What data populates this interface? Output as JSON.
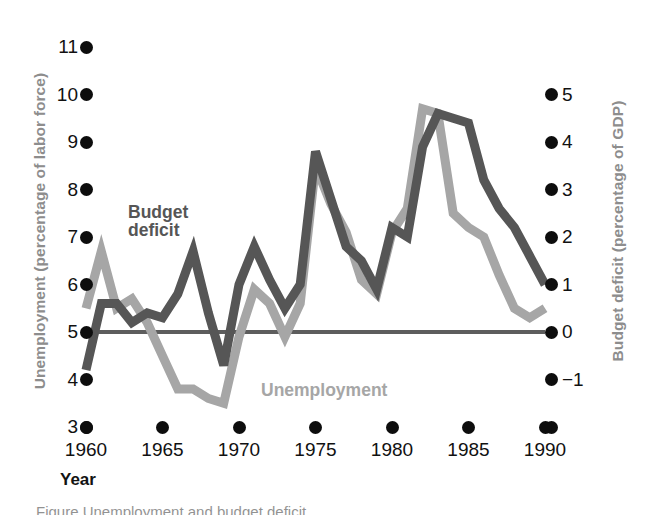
{
  "chart_data": {
    "type": "line",
    "title": "",
    "xlabel": "Year",
    "x_ticks": [
      "1960",
      "1965",
      "1970",
      "1975",
      "1980",
      "1985",
      "1990"
    ],
    "xlim": [
      1959,
      1991
    ],
    "grid": false,
    "legend_position": "inline-annotations",
    "axes": {
      "left": {
        "label": "Unemployment (percentage of labor force)",
        "ticks": [
          "11",
          "10",
          "9",
          "8",
          "7",
          "6",
          "5",
          "4",
          "3"
        ],
        "tick_values": [
          11,
          10,
          9,
          8,
          7,
          6,
          5,
          4,
          3
        ],
        "lim": [
          3,
          11
        ]
      },
      "right": {
        "label": "Budget deficit (percentage of GDP)",
        "ticks": [
          "5",
          "4",
          "3",
          "2",
          "1",
          "0",
          "−1"
        ],
        "tick_values": [
          5,
          4,
          3,
          2,
          1,
          0,
          -1
        ],
        "lim": [
          -2,
          5
        ]
      }
    },
    "reference_line": {
      "axis": "right",
      "value": 0,
      "color": "#5d5d5d"
    },
    "series": [
      {
        "name": "Budget deficit",
        "axis": "right",
        "color": "#565656",
        "label_text": "Budget\ndeficit",
        "x": [
          1960,
          1961,
          1962,
          1963,
          1964,
          1965,
          1966,
          1967,
          1968,
          1969,
          1970,
          1971,
          1972,
          1973,
          1974,
          1975,
          1976,
          1977,
          1978,
          1979,
          1980,
          1981,
          1982,
          1983,
          1984,
          1985,
          1986,
          1987,
          1988,
          1989,
          1990
        ],
        "values": [
          -0.8,
          0.6,
          0.6,
          0.2,
          0.4,
          0.3,
          0.8,
          1.7,
          0.4,
          -0.7,
          1.0,
          1.8,
          1.1,
          0.5,
          1.0,
          3.8,
          2.8,
          1.8,
          1.5,
          0.9,
          2.2,
          2.0,
          3.9,
          4.6,
          4.5,
          4.4,
          3.2,
          2.6,
          2.2,
          1.6,
          1.0
        ]
      },
      {
        "name": "Unemployment",
        "axis": "left",
        "color": "#a6a6a6",
        "label_text": "Unemployment",
        "x": [
          1960,
          1961,
          1962,
          1963,
          1964,
          1965,
          1966,
          1967,
          1968,
          1969,
          1970,
          1971,
          1972,
          1973,
          1974,
          1975,
          1976,
          1977,
          1978,
          1979,
          1980,
          1981,
          1982,
          1983,
          1984,
          1985,
          1986,
          1987,
          1988,
          1989,
          1990
        ],
        "values": [
          5.5,
          6.7,
          5.5,
          5.7,
          5.2,
          4.5,
          3.8,
          3.8,
          3.6,
          3.5,
          4.9,
          5.9,
          5.6,
          4.9,
          5.6,
          8.5,
          7.7,
          7.1,
          6.1,
          5.8,
          7.1,
          7.6,
          9.7,
          9.6,
          7.5,
          7.2,
          7.0,
          6.2,
          5.5,
          5.3,
          5.5
        ]
      }
    ]
  },
  "labels": {
    "ylabel_left": "Unemployment (percentage of labor force)",
    "ylabel_right": "Budget deficit (percentage of GDP)",
    "xlabel": "Year",
    "series_deficit": "Budget\ndeficit",
    "series_unemployment": "Unemployment"
  },
  "ticks": {
    "left": [
      "11",
      "10",
      "9",
      "8",
      "7",
      "6",
      "5",
      "4",
      "3"
    ],
    "right": [
      "5",
      "4",
      "3",
      "2",
      "1",
      "0",
      "−1"
    ],
    "x": [
      "1960",
      "1965",
      "1970",
      "1975",
      "1980",
      "1985",
      "1990"
    ]
  },
  "colors": {
    "deficit_line": "#565656",
    "unemployment_line": "#a6a6a6",
    "tick_dot": "#0d0d0d",
    "axis_title": "#8d8d8d",
    "reference_line": "#5d5d5d"
  },
  "caption": {
    "clipped_text": "Figure  Unemployment and budget deficit"
  }
}
